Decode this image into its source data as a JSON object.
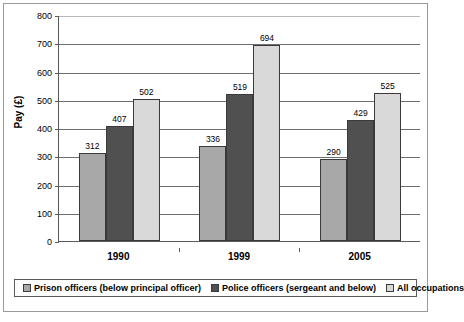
{
  "chart_data": {
    "type": "bar",
    "title": "",
    "subtitle": "",
    "xlabel": "",
    "ylabel": "Pay (£)",
    "categories": [
      "1990",
      "1999",
      "2005"
    ],
    "series": [
      {
        "name": "Prison officers (below principal officer)",
        "color": "#a8a8a8",
        "values": [
          312,
          336,
          290
        ]
      },
      {
        "name": "Police officers (sergeant and below)",
        "color": "#505050",
        "values": [
          407,
          519,
          429
        ]
      },
      {
        "name": "All occupations",
        "color": "#d9d9d9",
        "values": [
          502,
          694,
          525
        ]
      }
    ],
    "grouped_values": [
      {
        "category": "1990",
        "values": [
          312,
          336,
          290
        ]
      },
      {
        "category": "1999",
        "values": [
          407,
          519,
          429
        ]
      },
      {
        "category": "2005",
        "values": [
          502,
          694,
          525
        ]
      }
    ],
    "ylim": [
      0,
      800
    ],
    "ytick_step": 100,
    "yticks": [
      "800",
      "700",
      "600",
      "500",
      "400",
      "300",
      "200",
      "100",
      "0"
    ],
    "grid": true,
    "grid_orientation": "horizontal",
    "legend_position": "bottom"
  },
  "legend": {
    "entries": [
      {
        "label": "Prison officers (below principal officer)",
        "color": "#a8a8a8"
      },
      {
        "label": "Police officers (sergeant and below)",
        "color": "#505050"
      },
      {
        "label": "All occupations",
        "color": "#d9d9d9"
      }
    ]
  },
  "colors": {
    "series_1": "#a8a8a8",
    "series_2": "#505050",
    "series_3": "#d9d9d9",
    "axis": "#5a5a5a",
    "gridline": "#6f6f6f",
    "frame": "#9a9a9a",
    "text": "#000000",
    "background": "#ffffff"
  }
}
